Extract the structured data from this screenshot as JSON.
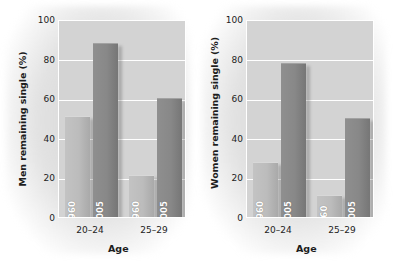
{
  "figure": {
    "background_color": "#ffffff",
    "panel_background_color": "#d3d3d3",
    "gridline_color": "#ffffff",
    "light_bar_color": "#bcbcbc",
    "dark_bar_color": "#888888"
  },
  "chart_data": [
    {
      "type": "bar",
      "title": "",
      "panel": "men",
      "xlabel": "Age",
      "ylabel": "Men remaining single (%)",
      "categories": [
        "20–24",
        "25–29"
      ],
      "series": [
        {
          "name": "1960",
          "values": [
            51,
            21
          ],
          "color": "#bcbcbc"
        },
        {
          "name": "2005",
          "values": [
            88,
            60
          ],
          "color": "#888888"
        }
      ],
      "bar_labels": [
        [
          "1960",
          "2005"
        ],
        [
          "1960",
          "2005"
        ]
      ],
      "ylim": [
        0,
        100
      ],
      "yticks": [
        0,
        20,
        40,
        60,
        80,
        100
      ],
      "ytick_labels": [
        "0",
        "20",
        "40",
        "60",
        "80",
        "100"
      ],
      "grid": true,
      "legend": "none"
    },
    {
      "type": "bar",
      "title": "",
      "panel": "women",
      "xlabel": "Age",
      "ylabel": "Women remaining single (%)",
      "categories": [
        "20–24",
        "25–29"
      ],
      "series": [
        {
          "name": "1960",
          "values": [
            28,
            11
          ],
          "color": "#bcbcbc"
        },
        {
          "name": "2005",
          "values": [
            78,
            50
          ],
          "color": "#888888"
        }
      ],
      "bar_labels": [
        [
          "1960",
          "2005"
        ],
        [
          "'60",
          "2005"
        ]
      ],
      "ylim": [
        0,
        100
      ],
      "yticks": [
        0,
        20,
        40,
        60,
        80,
        100
      ],
      "ytick_labels": [
        "0",
        "20",
        "40",
        "60",
        "80",
        "100"
      ],
      "grid": true,
      "legend": "none"
    }
  ]
}
